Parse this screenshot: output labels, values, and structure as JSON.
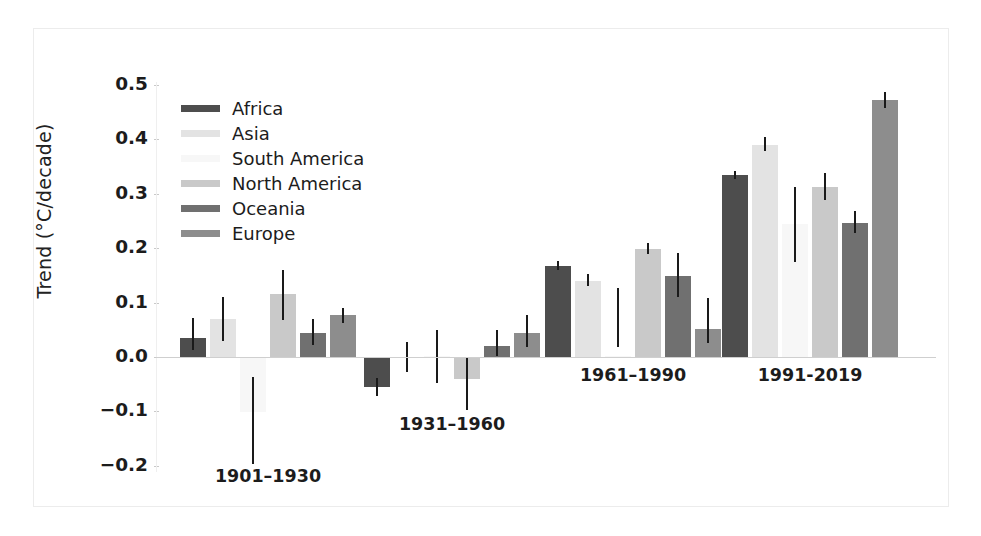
{
  "chart_data": {
    "type": "bar",
    "title": "",
    "subtitle": "",
    "xlabel": "",
    "ylabel": "Trend (°C/decade)",
    "categories": [
      "1901–1930",
      "1931–1960",
      "1961–1990",
      "1991-2019"
    ],
    "ylim": [
      -0.2,
      0.5
    ],
    "yticks": [
      0.5,
      0.4,
      0.3,
      0.2,
      0.1,
      0.0,
      -0.1,
      -0.2
    ],
    "ytick_labels": [
      "0.5",
      "0.4",
      "0.3",
      "0.2",
      "0.1",
      "0.0",
      "−0.1",
      "−0.2"
    ],
    "grid": false,
    "legend_position": "upper left",
    "error_bars": true,
    "series": [
      {
        "name": "Africa",
        "color": "#4d4d4d",
        "values": [
          0.035,
          -0.055,
          0.167,
          0.335
        ],
        "err_low": [
          0.012,
          -0.072,
          0.159,
          0.328
        ],
        "err_high": [
          0.072,
          -0.038,
          0.176,
          0.342
        ]
      },
      {
        "name": "Asia",
        "color": "#e3e3e3",
        "values": [
          0.069,
          0.0,
          0.14,
          0.39
        ],
        "err_low": [
          0.03,
          -0.028,
          0.13,
          0.378
        ],
        "err_high": [
          0.11,
          0.028,
          0.152,
          0.405
        ]
      },
      {
        "name": "South America",
        "color": "#f7f7f7",
        "values": [
          -0.102,
          0.002,
          0.001,
          0.245
        ],
        "err_low": [
          -0.196,
          -0.047,
          0.019,
          0.175
        ],
        "err_high": [
          -0.036,
          0.05,
          0.126,
          0.312
        ]
      },
      {
        "name": "North America",
        "color": "#c9c9c9",
        "values": [
          0.115,
          -0.04,
          0.198,
          0.312
        ],
        "err_low": [
          0.068,
          -0.098,
          0.189,
          0.288
        ],
        "err_high": [
          0.16,
          -0.002,
          0.21,
          0.338
        ]
      },
      {
        "name": "Oceania",
        "color": "#707070",
        "values": [
          0.045,
          0.02,
          0.148,
          0.246
        ],
        "err_low": [
          0.022,
          0.001,
          0.11,
          0.228
        ],
        "err_high": [
          0.07,
          0.05,
          0.191,
          0.268
        ]
      },
      {
        "name": "Europe",
        "color": "#8d8d8d",
        "values": [
          0.077,
          0.045,
          0.052,
          0.472
        ],
        "err_low": [
          0.062,
          0.018,
          0.025,
          0.458
        ],
        "err_high": [
          0.09,
          0.077,
          0.108,
          0.487
        ]
      }
    ]
  },
  "legend": {
    "items": [
      {
        "label": "Africa",
        "color": "#4d4d4d"
      },
      {
        "label": "Asia",
        "color": "#e3e3e3"
      },
      {
        "label": "South America",
        "color": "#f7f7f7"
      },
      {
        "label": "North America",
        "color": "#c9c9c9"
      },
      {
        "label": "Oceania",
        "color": "#707070"
      },
      {
        "label": "Europe",
        "color": "#8d8d8d"
      }
    ]
  },
  "axis": {
    "y_title": "Trend (°C/decade)"
  }
}
